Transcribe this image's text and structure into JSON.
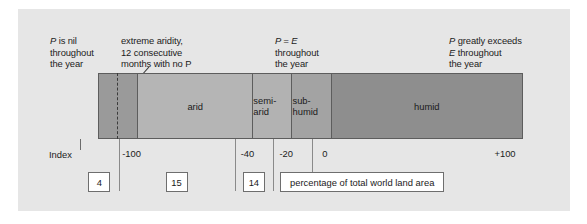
{
  "figure": {
    "background_color": "#e6e6e6",
    "annotations": [
      {
        "id": "annot-nil",
        "line1_italic": "P",
        "line1_rest": " is nil",
        "line2": "throughout",
        "line3": "the year"
      },
      {
        "id": "annot-aridity",
        "line1_italic": "",
        "line1_rest": "extreme aridity,",
        "line2": "12 consecutive",
        "line3": "months with no P"
      },
      {
        "id": "annot-equal",
        "line1_italic": "P = E",
        "line1_rest": "",
        "line2": "throughout",
        "line3": "the year"
      },
      {
        "id": "annot-exceeds",
        "line1_italic": "P",
        "line1_rest": " greatly exceeds",
        "line2_italic": "E",
        "line2": " throughout",
        "line3": "the year"
      }
    ]
  },
  "axis": {
    "name_label": "Index",
    "ticks": [
      {
        "label": "-100",
        "value": -100
      },
      {
        "label": "-40",
        "value": -40
      },
      {
        "label": "-20",
        "value": -20
      },
      {
        "label": "0",
        "value": 0
      },
      {
        "label": "+100",
        "value": 100
      }
    ]
  },
  "legend": {
    "caption": "percentage of total world land area"
  },
  "chart_data": {
    "type": "bar",
    "title": "",
    "subtitle": "",
    "orientation": "horizontal-stacked",
    "xlabel": "Index",
    "ylabel": "",
    "xlim": [
      -120,
      100
    ],
    "grid": false,
    "legend_position": "bottom-right",
    "legend_label": "percentage of total world land area",
    "axis_tick_labels": [
      "-100",
      "-40",
      "-20",
      "0",
      "+100"
    ],
    "axis_tick_values": [
      -100,
      -40,
      -20,
      0,
      100
    ],
    "categories": [
      "hyper-arid",
      "arid",
      "semi-arid",
      "sub-humid",
      "humid"
    ],
    "bands": [
      {
        "label": "",
        "label_visible": false,
        "index_from": -120,
        "index_to": -100,
        "percentage_of_world_land_area": 4,
        "color": "#9a9a9a"
      },
      {
        "label": "arid",
        "label_visible": true,
        "index_from": -100,
        "index_to": -40,
        "percentage_of_world_land_area": 15,
        "color": "#b5b5b5"
      },
      {
        "label": "semi-arid",
        "label_visible": true,
        "index_from": -40,
        "index_to": -20,
        "percentage_of_world_land_area": 14,
        "color": "#b2b2b2"
      },
      {
        "label": "sub-humid",
        "label_visible": true,
        "index_from": -20,
        "index_to": 0,
        "percentage_of_world_land_area": null,
        "color": "#a3a3a3"
      },
      {
        "label": "humid",
        "label_visible": true,
        "index_from": 0,
        "index_to": 100,
        "percentage_of_world_land_area": null,
        "color": "#8e8e8e"
      }
    ],
    "value_boxes": [
      {
        "text": "4",
        "at_index": -110
      },
      {
        "text": "15",
        "at_index": -70
      },
      {
        "text": "14",
        "at_index": -30
      }
    ],
    "annotations": [
      "P is nil throughout the year",
      "extreme aridity, 12 consecutive months with no P",
      "P = E throughout the year",
      "P greatly exceeds E throughout the year"
    ]
  }
}
